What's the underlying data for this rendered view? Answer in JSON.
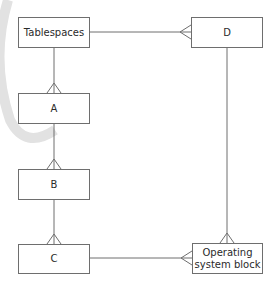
{
  "diagram": {
    "type": "entity-relationship",
    "entities": [
      {
        "id": "tablespaces",
        "label": "Tablespaces"
      },
      {
        "id": "d",
        "label": "D"
      },
      {
        "id": "a",
        "label": "A"
      },
      {
        "id": "b",
        "label": "B"
      },
      {
        "id": "c",
        "label": "C"
      },
      {
        "id": "os_block",
        "label": "Operating\nsystem block"
      }
    ],
    "relationships": [
      {
        "from": "tablespaces",
        "to": "d",
        "cardinality": "one-to-many"
      },
      {
        "from": "tablespaces",
        "to": "a",
        "cardinality": "one-to-many"
      },
      {
        "from": "a",
        "to": "b",
        "cardinality": "one-to-many"
      },
      {
        "from": "b",
        "to": "c",
        "cardinality": "one-to-many"
      },
      {
        "from": "c",
        "to": "os_block",
        "cardinality": "one-to-many"
      },
      {
        "from": "d",
        "to": "os_block",
        "cardinality": "one-to-many"
      }
    ],
    "colors": {
      "line": "#6e6e6e",
      "text": "#2a2a2a",
      "watermark": "#dcdcdc"
    }
  }
}
